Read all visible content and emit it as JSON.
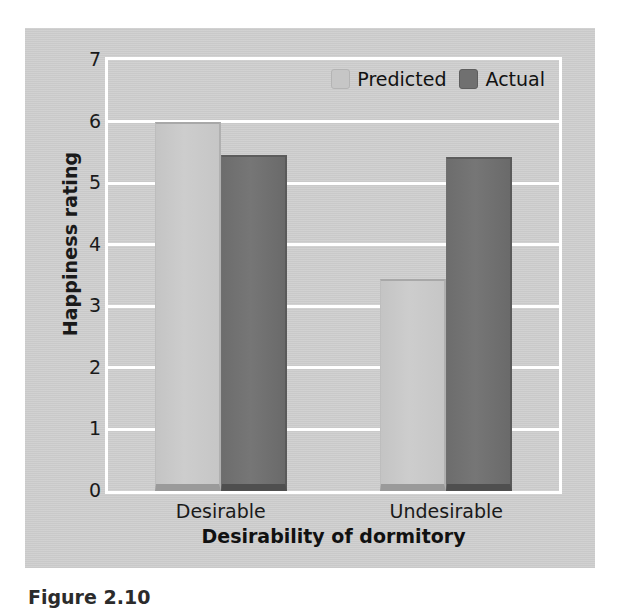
{
  "figure": {
    "caption": "Figure 2.10",
    "panel_background": "#c9c9c9"
  },
  "legend": {
    "position": "top-right-inside",
    "entries": [
      {
        "label": "Predicted",
        "color": "#c6c6c6",
        "swatch_name": "predicted-swatch"
      },
      {
        "label": "Actual",
        "color": "#707070",
        "swatch_name": "actual-swatch"
      }
    ]
  },
  "chart_data": {
    "type": "bar",
    "title": "",
    "subtitle": "",
    "xlabel": "Desirability of dormitory",
    "ylabel": "Happiness rating",
    "categories": [
      "Desirable",
      "Undesirable"
    ],
    "series": [
      {
        "name": "Predicted",
        "color": "#c6c6c6",
        "values": [
          6.0,
          3.45
        ]
      },
      {
        "name": "Actual",
        "color": "#707070",
        "values": [
          5.45,
          5.42
        ]
      }
    ],
    "ylim": [
      0,
      7
    ],
    "yticks": [
      0,
      1,
      2,
      3,
      4,
      5,
      6,
      7
    ],
    "ytick_labels": [
      "0",
      "1",
      "2",
      "3",
      "4",
      "5",
      "6",
      "7"
    ],
    "grid": true,
    "grid_orientation": "horizontal",
    "grid_color": "#ffffff",
    "legend_position": "upper right",
    "bars_grouped": true
  }
}
